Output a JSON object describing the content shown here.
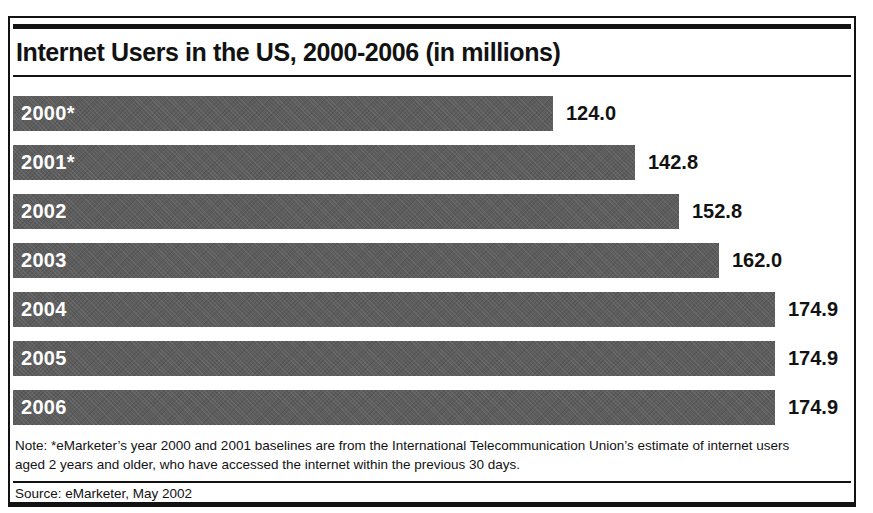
{
  "chart_data": {
    "type": "bar",
    "orientation": "horizontal",
    "title": "Internet Users in the US, 2000-2006 (in millions)",
    "categories": [
      "2000*",
      "2001*",
      "2002",
      "2003",
      "2004",
      "2005",
      "2006"
    ],
    "values": [
      124.0,
      142.8,
      152.8,
      162.0,
      174.9,
      174.9,
      174.9
    ],
    "value_labels": [
      "124.0",
      "142.8",
      "152.8",
      "162.0",
      "174.9",
      "174.9",
      "174.9"
    ],
    "xlabel": "",
    "ylabel": "",
    "xlim": [
      0,
      174.9
    ],
    "grid": "off",
    "legend": "none",
    "bar_labels_inside": true,
    "value_labels_position": "right-of-bar"
  },
  "note": {
    "line1": "Note: *eMarketer’s year 2000 and 2001 baselines are from the International Telecommunication Union’s estimate of internet users",
    "line2": "aged 2 years and older, who have accessed the internet within the previous 30 days."
  },
  "source": {
    "text": "Source: eMarketer, May 2002"
  },
  "colors": {
    "bar": "#5d5d5d",
    "bar_label": "#ffffff",
    "text": "#121212",
    "rule": "#121212",
    "background": "#ffffff"
  }
}
